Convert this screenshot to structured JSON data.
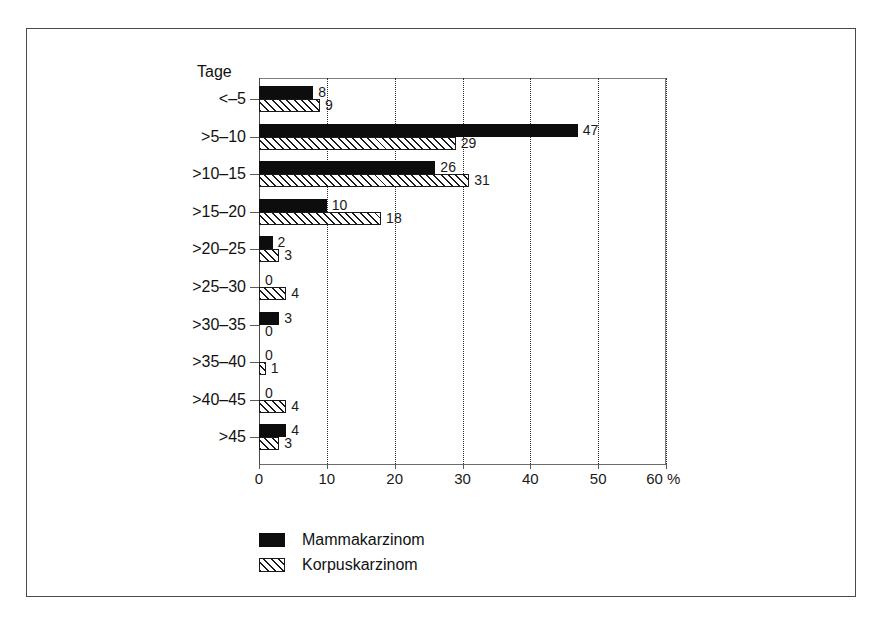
{
  "figure": {
    "axis_title": "Tage",
    "unit_suffix": "%"
  },
  "chart_data": {
    "type": "bar",
    "orientation": "horizontal",
    "title": "",
    "subtitle": "",
    "xlabel": "%",
    "ylabel": "Tage",
    "xlim": [
      0,
      60
    ],
    "xticks": [
      0,
      10,
      20,
      30,
      40,
      50,
      60
    ],
    "xtick_labels": [
      "0",
      "10",
      "20",
      "30",
      "40",
      "50",
      "60 %"
    ],
    "grid": "vertical-dotted",
    "legend_position": "below-left",
    "categories": [
      "<-5",
      ">5-10",
      ">10-15",
      ">15-20",
      ">20-25",
      ">25-30",
      ">30-35",
      ">35-40",
      ">40-45",
      ">45"
    ],
    "series": [
      {
        "name": "Mammakarzinom",
        "style": "solid-black",
        "values": [
          8,
          47,
          26,
          10,
          2,
          0,
          3,
          0,
          0,
          4
        ]
      },
      {
        "name": "Korpuskarzinom",
        "style": "hatched",
        "values": [
          9,
          29,
          31,
          18,
          3,
          4,
          0,
          1,
          4,
          3
        ]
      }
    ]
  },
  "legend": {
    "items": [
      {
        "label": "Mammakarzinom",
        "swatch": "solid-black"
      },
      {
        "label": "Korpuskarzinom",
        "swatch": "hatched"
      }
    ]
  },
  "colors": {
    "series_1": "#0d0d0d",
    "series_2_outline": "#1a1a1a",
    "frame": "#4a4a4a",
    "grid": "#2e2e2e",
    "background": "#ffffff"
  }
}
